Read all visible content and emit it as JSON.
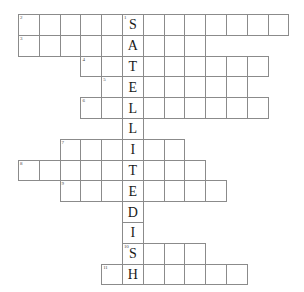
{
  "puzzle": {
    "title": "Satellite Dish Crossword",
    "type": "crossword-grid",
    "theme_answer": "SATELLITEDISH",
    "theme_orientation": "vertical",
    "grid": {
      "cell_size": 20.8,
      "origin_x": 18,
      "origin_y": 14,
      "rows": 13,
      "columns": 13,
      "border_color": "#8b8b8b",
      "cell_fill": "#ffffff",
      "letter_color": "#1a1a1a",
      "number_color": "#4a4a4a"
    },
    "spine": {
      "column": 5,
      "letters": [
        "S",
        "A",
        "T",
        "E",
        "L",
        "L",
        "I",
        "T",
        "E",
        "D",
        "I",
        "S",
        "H"
      ],
      "start_row": 0,
      "number": "1"
    },
    "entries": [
      {
        "number": "2",
        "row": 0,
        "start_col": 0,
        "end_col": 12
      },
      {
        "number": "3",
        "row": 1,
        "start_col": 0,
        "end_col": 8
      },
      {
        "number": "4",
        "row": 2,
        "start_col": 3,
        "end_col": 11
      },
      {
        "number": "5",
        "row": 3,
        "start_col": 4,
        "end_col": 10
      },
      {
        "number": "6",
        "row": 4,
        "start_col": 3,
        "end_col": 11
      },
      {
        "number": "7",
        "row": 6,
        "start_col": 2,
        "end_col": 7
      },
      {
        "number": "8",
        "row": 7,
        "start_col": 0,
        "end_col": 8
      },
      {
        "number": "9",
        "row": 8,
        "start_col": 2,
        "end_col": 9
      },
      {
        "number": "10",
        "row": 11,
        "start_col": 5,
        "end_col": 8
      },
      {
        "number": "11",
        "row": 12,
        "start_col": 4,
        "end_col": 10
      }
    ]
  }
}
